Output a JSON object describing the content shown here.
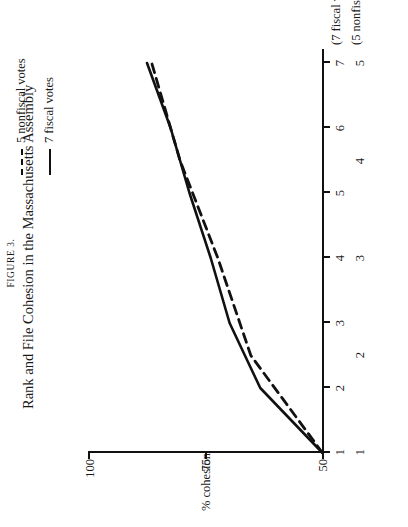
{
  "figure": {
    "number_label": "FIGURE 3.",
    "title": "Rank and File Cohesion in the Massachusetts Assembly"
  },
  "legend": {
    "position": "top-right",
    "entries": [
      {
        "label": "5 nonfiscal votes",
        "style": "dashed",
        "color": "#111111"
      },
      {
        "label": "7 fiscal votes",
        "style": "solid",
        "color": "#111111"
      }
    ]
  },
  "axes": {
    "y_axis_label": "% cohesion",
    "y_ticks": [
      "50",
      "75",
      "100"
    ],
    "x_axis_name_primary": "(7 fiscal votes)",
    "x_axis_name_secondary": "(5 nonfiscal votes)",
    "x_ticks_fiscal": [
      "1",
      "2",
      "3",
      "4",
      "5",
      "6",
      "7"
    ],
    "x_ticks_nonfiscal": [
      "1",
      "2",
      "3",
      "4",
      "5"
    ]
  },
  "chart_data": {
    "type": "line",
    "title": "Rank and File Cohesion in the Massachusetts Assembly",
    "xlabel": "(7 fiscal votes) / (5 nonfiscal votes)",
    "ylabel": "% cohesion",
    "ylim": [
      50,
      100
    ],
    "yticks": [
      50,
      75,
      100
    ],
    "grid": false,
    "legend_position": "top-right",
    "series": [
      {
        "name": "7 fiscal votes",
        "style": "solid",
        "color": "#111111",
        "x": [
          1,
          2,
          3,
          4,
          5,
          6,
          7
        ],
        "xticklabels": [
          "1",
          "2",
          "3",
          "4",
          "5",
          "6",
          "7"
        ],
        "values": [
          50.3,
          63.5,
          70.0,
          74.0,
          78.5,
          82.5,
          87.5
        ]
      },
      {
        "name": "5 nonfiscal votes",
        "style": "dashed",
        "color": "#111111",
        "x": [
          1,
          2,
          3,
          4,
          5
        ],
        "xticklabels": [
          "1",
          "2",
          "3",
          "4",
          "5"
        ],
        "values": [
          50.3,
          65.5,
          72.5,
          80.5,
          86.5
        ]
      }
    ]
  }
}
